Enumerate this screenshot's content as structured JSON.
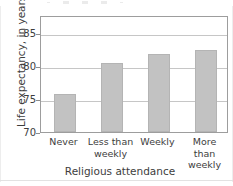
{
  "chart_data": {
    "type": "bar",
    "title": "",
    "subtitle": "",
    "xlabel": "Religious attendance",
    "ylabel": "Life expectancy, in years",
    "categories": [
      "Never",
      "Less than\nweekly",
      "Weekly",
      "More than\nweekly"
    ],
    "category_labels_flat": [
      "Never",
      "Less than weekly",
      "Weekly",
      "More than weekly"
    ],
    "values": [
      75.3,
      79.8,
      81.0,
      81.6
    ],
    "ylim": [
      70,
      86.5
    ],
    "yticks": [
      70,
      75,
      80,
      85
    ],
    "ytick_labels": [
      "70",
      "75",
      "80",
      "85"
    ],
    "grid": true,
    "grid_axis": "y",
    "legend": false,
    "legend_position": "none",
    "bar_color": "#c2c2c2",
    "bar_edge_color": "#b4b4b4",
    "gridline_color": "#c6c6c6",
    "axis_color": "#9d9d9d",
    "text_color": "#3d3d3d",
    "background_color": "#ffffff"
  },
  "axes": {
    "y_tick_0": "70",
    "y_tick_1": "75",
    "y_tick_2": "80",
    "y_tick_3": "85",
    "y_axis_title": "Life expectancy, in years",
    "x_axis_title": "Religious attendance",
    "x_tick_0": "Never",
    "x_tick_1": "Less than\nweekly",
    "x_tick_2": "Weekly",
    "x_tick_3": "More than\nweekly"
  }
}
